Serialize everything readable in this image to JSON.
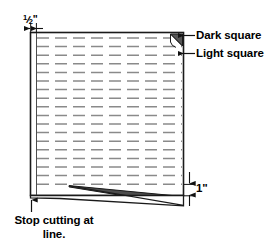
{
  "diagram": {
    "type": "instructional-cutting-diagram",
    "colors": {
      "outline": "#1a1a1a",
      "dash_line": "#8a8a8a",
      "dark_square_fill": "#555555",
      "sliver_fill": "#4d4d4d",
      "background": "#ffffff",
      "text": "#000000"
    },
    "sheet": {
      "label": "fabric-sheet",
      "left_margin_label": "half-inch-margin"
    },
    "annotations": {
      "half_inch": {
        "numerator": "1",
        "divider": "/",
        "denominator": "2",
        "unit": "\"",
        "full_text": "1/2\""
      },
      "dark_square": "Dark square",
      "light_square": "Light square",
      "one_inch": "1\"",
      "stop_cutting": "Stop cutting at line."
    },
    "dash_rows": [
      38,
      46.6,
      55.2,
      63.8,
      72.4,
      81,
      89.6,
      98.2,
      106.8,
      115.4,
      124,
      132.6,
      141.2,
      149.8,
      158.4,
      167,
      175.6,
      184.2
    ]
  }
}
